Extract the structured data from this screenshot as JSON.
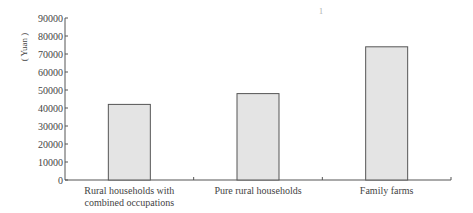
{
  "chart_data": {
    "type": "bar",
    "title": "",
    "xlabel": "",
    "ylabel": "( Yuan )",
    "ylim": [
      0,
      90000
    ],
    "yticks": [
      0,
      10000,
      20000,
      30000,
      40000,
      50000,
      60000,
      70000,
      80000,
      90000
    ],
    "ytick_labels": [
      "0",
      "10000",
      "20000",
      "30000",
      "40000",
      "50000",
      "60000",
      "70000",
      "80000",
      "90000"
    ],
    "categories": [
      [
        "Rural households with",
        "combined occupations"
      ],
      [
        "Pure rural  households"
      ],
      [
        "Family farms"
      ]
    ],
    "values": [
      42000,
      48000,
      74000
    ],
    "grid": false,
    "legend": "none",
    "bar_fill": "#e4e4e4",
    "bar_stroke": "#555555",
    "annotation": "1"
  }
}
